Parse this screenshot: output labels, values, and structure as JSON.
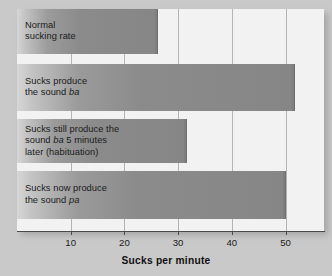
{
  "chart_data": {
    "type": "bar",
    "orientation": "horizontal",
    "title": "",
    "xlabel": "Sucks per minute",
    "ylabel": "",
    "xlim": [
      0,
      57.2
    ],
    "xticks": [
      10,
      20,
      30,
      40,
      50
    ],
    "xtick_labels": [
      "10",
      "20",
      "30",
      "40",
      "50"
    ],
    "grid": "vertical",
    "legend": "none",
    "categories": [
      "Normal sucking rate",
      "Sucks produce the sound ba",
      "Sucks still produce the sound ba 5 minutes later (habituation)",
      "Sucks now produce the sound pa"
    ],
    "values": [
      26.3,
      51.8,
      31.6,
      50.0
    ],
    "bars": [
      {
        "value": 26.3,
        "lines": [
          [
            {
              "text": "Normal",
              "italic": false
            }
          ],
          [
            {
              "text": "sucking rate",
              "italic": false
            }
          ]
        ]
      },
      {
        "value": 51.8,
        "lines": [
          [
            {
              "text": "Sucks produce",
              "italic": false
            }
          ],
          [
            {
              "text": "the sound ",
              "italic": false
            },
            {
              "text": "ba",
              "italic": true
            }
          ]
        ]
      },
      {
        "value": 31.6,
        "lines": [
          [
            {
              "text": "Sucks still produce the",
              "italic": false
            }
          ],
          [
            {
              "text": "sound ",
              "italic": false
            },
            {
              "text": "ba",
              "italic": true
            },
            {
              "text": " 5 minutes",
              "italic": false
            }
          ],
          [
            {
              "text": "later (habituation)",
              "italic": false
            }
          ]
        ]
      },
      {
        "value": 50.0,
        "lines": [
          [
            {
              "text": "Sucks now produce",
              "italic": false
            }
          ],
          [
            {
              "text": "the sound ",
              "italic": false
            },
            {
              "text": "pa",
              "italic": true
            }
          ]
        ]
      }
    ],
    "colors": {
      "bar_fill_light": "#d6d6d6",
      "bar_fill_dark": "#868686",
      "plot_background": "#f2f2f2",
      "page_background": "#c9c9c9",
      "gridline": "#b4b4b4",
      "axis": "#4a4a4a",
      "text": "#1b1b1b"
    },
    "geometry": {
      "plot_left": 17,
      "plot_top": 9,
      "plot_width": 307,
      "plot_height": 222,
      "units_per_pixel": 0.1862,
      "pixels_per_unit": 5.37,
      "bar_tops": [
        9,
        64,
        119,
        171
      ],
      "bar_heights": [
        45,
        47,
        44,
        48
      ]
    }
  }
}
